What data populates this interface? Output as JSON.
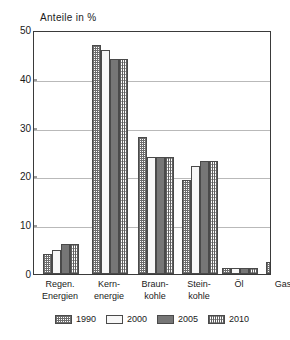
{
  "chart_data": {
    "type": "bar",
    "title": "Anteile in %",
    "xlabel": "",
    "ylabel": "",
    "ylim": [
      0,
      50
    ],
    "yticks": [
      0,
      10,
      20,
      30,
      40,
      50
    ],
    "grid": true,
    "legend_position": "bottom",
    "categories": [
      "Regen. Energien",
      "Kern- energie",
      "Braun- kohle",
      "Stein- kohle",
      "Öl",
      "Gas"
    ],
    "category_lines": [
      {
        "line1": "Regen.",
        "line2": "Energien"
      },
      {
        "line1": "Kern-",
        "line2": "energie"
      },
      {
        "line1": "Braun-",
        "line2": "kohle"
      },
      {
        "line1": "Stein-",
        "line2": "kohle"
      },
      {
        "line1": "Öl",
        "line2": ""
      },
      {
        "line1": "Gas",
        "line2": ""
      }
    ],
    "series": [
      {
        "name": "1990",
        "values": [
          4.0,
          47.0,
          28.0,
          19.3,
          1.3,
          2.5
        ]
      },
      {
        "name": "2000",
        "values": [
          5.0,
          46.0,
          24.0,
          22.2,
          1.3,
          2.5
        ]
      },
      {
        "name": "2005",
        "values": [
          6.1,
          44.0,
          24.0,
          23.2,
          1.3,
          2.5
        ]
      },
      {
        "name": "2010",
        "values": [
          6.1,
          44.0,
          24.0,
          23.2,
          1.3,
          2.5
        ]
      }
    ]
  },
  "legend": {
    "entries": [
      {
        "label": "1990",
        "pattern": "cross-hatch"
      },
      {
        "label": "2000",
        "pattern": "solid-white"
      },
      {
        "label": "2005",
        "pattern": "solid-dark-gray"
      },
      {
        "label": "2010",
        "pattern": "vertical-hatch"
      }
    ]
  },
  "colors": {
    "axis": "#3a3a3a",
    "grid": "#b9b9b9",
    "series_1990": "#6d6d6d",
    "series_2000": "#f7f7f7",
    "series_2005": "#767676",
    "series_2010": "#5e5e5e",
    "background": "#ffffff"
  }
}
